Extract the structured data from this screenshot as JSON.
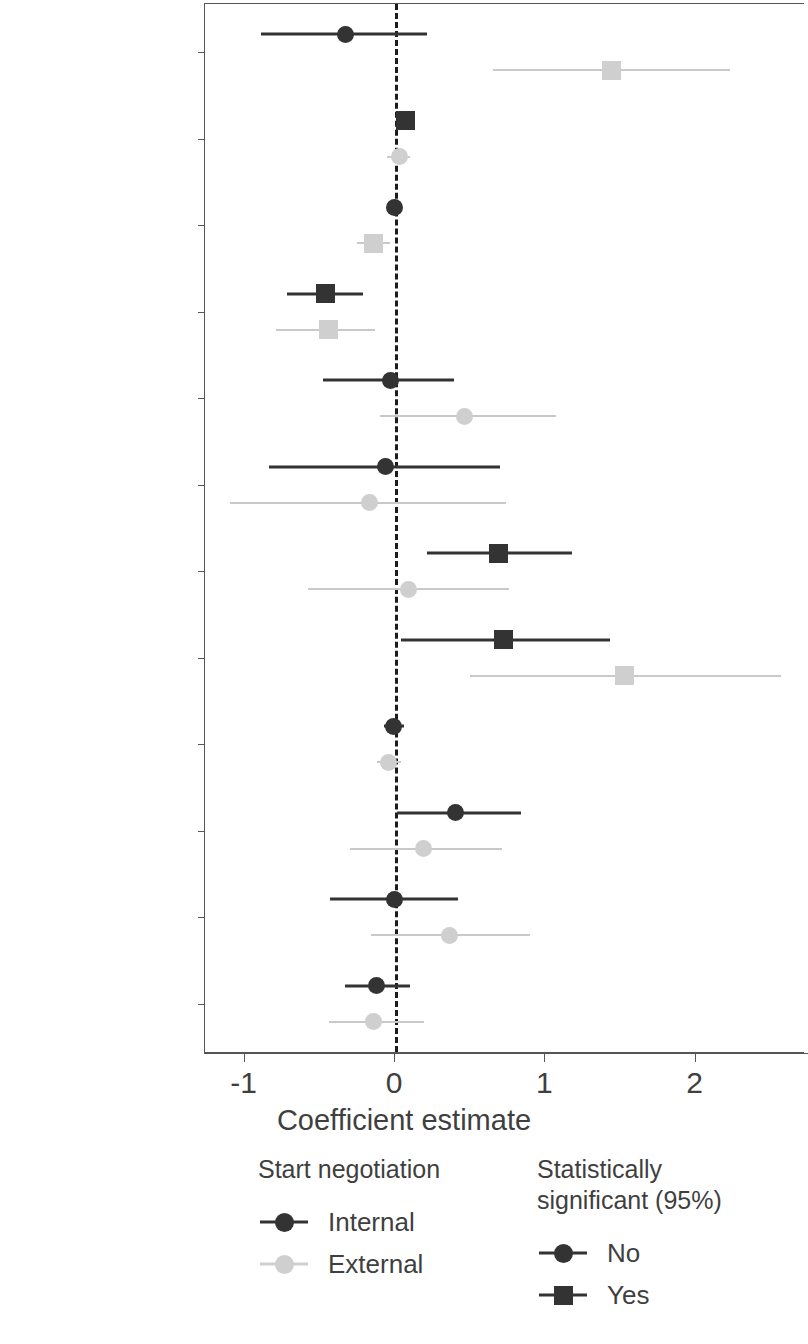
{
  "chart_data": {
    "type": "scatter",
    "subtype": "coefficient-forest-plot",
    "title": "",
    "xlabel": "Coefficient estimate",
    "ylabel": "",
    "xlim": [
      -1.35,
      2.7
    ],
    "xticks": [
      -1,
      0,
      1,
      2
    ],
    "xticklabels": [
      "-1",
      "0",
      "1",
      "2"
    ],
    "grid": false,
    "reference_line": {
      "x": 0,
      "style": "dashed",
      "color": "#1c1c1c"
    },
    "categories": [
      "Minor-power war",
      "Recent\nimbalance",
      "Overall\nimbalance",
      "Issue salience",
      "Contiguity",
      "CINC ratio",
      "Democratic\ninitiator",
      "Nuclear",
      "Number of states",
      "Opp. diplomatic\nrepresentation",
      "Major allies",
      "Completed\nbattles"
    ],
    "series": [
      {
        "name": "Internal",
        "color": "#333333",
        "points": [
          {
            "category": "Minor-power war",
            "estimate": -0.33,
            "ci_low": -0.89,
            "ci_high": 0.21,
            "significant": false,
            "marker": "circle"
          },
          {
            "category": "Recent imbalance",
            "estimate": 0.07,
            "ci_low": 0.01,
            "ci_high": 0.13,
            "significant": true,
            "marker": "square"
          },
          {
            "category": "Overall imbalance",
            "estimate": 0.0,
            "ci_low": -0.02,
            "ci_high": 0.02,
            "significant": false,
            "marker": "circle"
          },
          {
            "category": "Issue salience",
            "estimate": -0.46,
            "ci_low": -0.72,
            "ci_high": -0.21,
            "significant": true,
            "marker": "square"
          },
          {
            "category": "Contiguity",
            "estimate": -0.03,
            "ci_low": -0.48,
            "ci_high": 0.39,
            "significant": false,
            "marker": "circle"
          },
          {
            "category": "CINC ratio",
            "estimate": -0.06,
            "ci_low": -0.84,
            "ci_high": 0.7,
            "significant": false,
            "marker": "circle"
          },
          {
            "category": "Democratic initiator",
            "estimate": 0.69,
            "ci_low": 0.21,
            "ci_high": 1.18,
            "significant": true,
            "marker": "square"
          },
          {
            "category": "Nuclear",
            "estimate": 0.72,
            "ci_low": 0.04,
            "ci_high": 1.43,
            "significant": true,
            "marker": "square"
          },
          {
            "category": "Number of states",
            "estimate": -0.01,
            "ci_low": -0.07,
            "ci_high": 0.06,
            "significant": false,
            "marker": "circle"
          },
          {
            "category": "Opp. diplomatic representation",
            "estimate": 0.4,
            "ci_low": 0.01,
            "ci_high": 0.84,
            "significant": false,
            "marker": "circle"
          },
          {
            "category": "Major allies",
            "estimate": 0.0,
            "ci_low": -0.43,
            "ci_high": 0.42,
            "significant": false,
            "marker": "circle"
          },
          {
            "category": "Completed battles",
            "estimate": -0.12,
            "ci_low": -0.33,
            "ci_high": 0.1,
            "significant": false,
            "marker": "circle"
          }
        ]
      },
      {
        "name": "External",
        "color": "#cfcfcf",
        "points": [
          {
            "category": "Minor-power war",
            "estimate": 1.44,
            "ci_low": 0.65,
            "ci_high": 2.23,
            "significant": true,
            "marker": "square"
          },
          {
            "category": "Recent imbalance",
            "estimate": 0.03,
            "ci_low": -0.05,
            "ci_high": 0.1,
            "significant": false,
            "marker": "circle"
          },
          {
            "category": "Overall imbalance",
            "estimate": -0.14,
            "ci_low": -0.25,
            "ci_high": -0.03,
            "significant": true,
            "marker": "square"
          },
          {
            "category": "Issue salience",
            "estimate": -0.44,
            "ci_low": -0.79,
            "ci_high": -0.13,
            "significant": true,
            "marker": "square"
          },
          {
            "category": "Contiguity",
            "estimate": 0.46,
            "ci_low": -0.1,
            "ci_high": 1.07,
            "significant": false,
            "marker": "circle"
          },
          {
            "category": "CINC ratio",
            "estimate": -0.17,
            "ci_low": -1.1,
            "ci_high": 0.74,
            "significant": false,
            "marker": "circle"
          },
          {
            "category": "Democratic initiator",
            "estimate": 0.09,
            "ci_low": -0.58,
            "ci_high": 0.76,
            "significant": false,
            "marker": "circle"
          },
          {
            "category": "Nuclear",
            "estimate": 1.53,
            "ci_low": 0.5,
            "ci_high": 2.57,
            "significant": true,
            "marker": "square"
          },
          {
            "category": "Number of states",
            "estimate": -0.04,
            "ci_low": -0.12,
            "ci_high": 0.04,
            "significant": false,
            "marker": "circle"
          },
          {
            "category": "Opp. diplomatic representation",
            "estimate": 0.19,
            "ci_low": -0.3,
            "ci_high": 0.71,
            "significant": false,
            "marker": "circle"
          },
          {
            "category": "Major allies",
            "estimate": 0.36,
            "ci_low": -0.16,
            "ci_high": 0.9,
            "significant": false,
            "marker": "circle"
          },
          {
            "category": "Completed battles",
            "estimate": -0.14,
            "ci_low": -0.44,
            "ci_high": 0.19,
            "significant": false,
            "marker": "circle"
          }
        ]
      }
    ]
  },
  "axis": {
    "x_title": "Coefficient estimate"
  },
  "legends": [
    {
      "title": "Start negotiation",
      "items": [
        {
          "label": "Internal",
          "marker": "circle",
          "color": "#333333"
        },
        {
          "label": "External",
          "marker": "circle",
          "color": "#cfcfcf"
        }
      ]
    },
    {
      "title": "Statistically\nsignificant (95%)",
      "items": [
        {
          "label": "No",
          "marker": "circle",
          "color": "#333333"
        },
        {
          "label": "Yes",
          "marker": "square",
          "color": "#333333"
        }
      ]
    }
  ]
}
